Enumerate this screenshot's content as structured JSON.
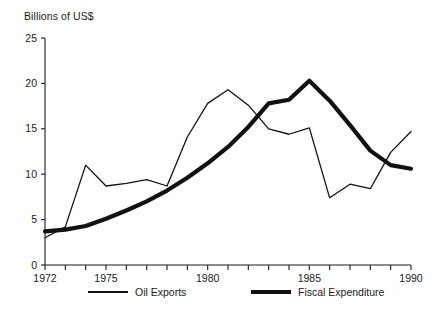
{
  "chart_data": {
    "type": "line",
    "title": "",
    "ylabel": "Billions of US$",
    "xlabel": "",
    "ylim": [
      0,
      25
    ],
    "xlim": [
      1972,
      1990
    ],
    "yticks": [
      0,
      5,
      10,
      15,
      20,
      25
    ],
    "ytick_labels": [
      "0",
      "5",
      "10",
      "15",
      "20",
      "25"
    ],
    "xticks": [
      1972,
      1973,
      1974,
      1975,
      1976,
      1977,
      1978,
      1979,
      1980,
      1981,
      1982,
      1983,
      1984,
      1985,
      1986,
      1987,
      1988,
      1989,
      1990
    ],
    "xtick_labels": [
      "1972",
      "",
      "",
      "1975",
      "",
      "",
      "",
      "",
      "1980",
      "",
      "",
      "",
      "",
      "1985",
      "",
      "",
      "",
      "",
      "1990"
    ],
    "grid": false,
    "legend_position": "bottom",
    "x": [
      1972,
      1973,
      1974,
      1975,
      1976,
      1977,
      1978,
      1979,
      1980,
      1981,
      1982,
      1983,
      1984,
      1985,
      1986,
      1987,
      1988,
      1989,
      1990
    ],
    "series": [
      {
        "name": "Oil Exports",
        "style": "thin",
        "color": "#111111",
        "values": [
          3.0,
          4.2,
          11.0,
          8.7,
          9.0,
          9.4,
          8.7,
          14.1,
          17.8,
          19.3,
          17.6,
          15.0,
          14.4,
          15.1,
          7.4,
          8.9,
          8.4,
          12.4,
          14.7
        ]
      },
      {
        "name": "Fiscal Expenditure",
        "style": "thick",
        "color": "#111111",
        "values": [
          3.7,
          3.9,
          4.3,
          5.1,
          6.0,
          7.0,
          8.2,
          9.6,
          11.2,
          13.0,
          15.2,
          17.8,
          18.2,
          20.3,
          18.1,
          15.4,
          12.6,
          11.0,
          10.6
        ]
      }
    ]
  },
  "legend": {
    "items": [
      {
        "label": "Oil Exports"
      },
      {
        "label": "Fiscal Expenditure"
      }
    ]
  }
}
